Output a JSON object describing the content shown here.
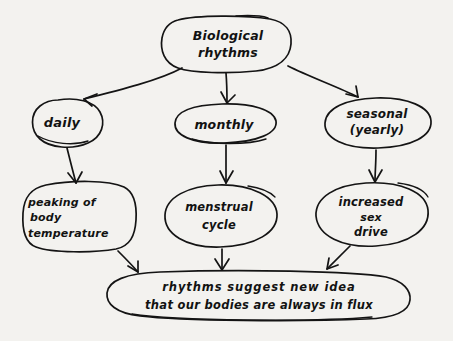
{
  "diagram": {
    "style": "hand-drawn-ink-on-paper",
    "ink_color": "#141414",
    "paper_color": "#f3f2ef",
    "nodes": [
      {
        "id": "root",
        "lines": [
          "Biological",
          "rhythms"
        ],
        "tier": 0
      },
      {
        "id": "daily",
        "lines": [
          "daily"
        ],
        "tier": 1
      },
      {
        "id": "monthly",
        "lines": [
          "monthly"
        ],
        "tier": 1
      },
      {
        "id": "seasonal",
        "lines": [
          "seasonal",
          "(yearly)"
        ],
        "tier": 1
      },
      {
        "id": "peaking",
        "lines": [
          "peaking of",
          "body",
          "temperature"
        ],
        "tier": 2
      },
      {
        "id": "menstrual",
        "lines": [
          "menstrual",
          "cycle"
        ],
        "tier": 2
      },
      {
        "id": "sexdrive",
        "lines": [
          "increased",
          "sex",
          "drive"
        ],
        "tier": 2
      },
      {
        "id": "conclusion",
        "lines": [
          "rhythms  suggest  new  idea",
          "that our bodies are always in flux"
        ],
        "tier": 3
      }
    ],
    "edges": [
      {
        "from": "root",
        "to": "daily"
      },
      {
        "from": "root",
        "to": "monthly"
      },
      {
        "from": "root",
        "to": "seasonal"
      },
      {
        "from": "daily",
        "to": "peaking"
      },
      {
        "from": "monthly",
        "to": "menstrual"
      },
      {
        "from": "seasonal",
        "to": "sexdrive"
      },
      {
        "from": "peaking",
        "to": "conclusion"
      },
      {
        "from": "menstrual",
        "to": "conclusion"
      },
      {
        "from": "sexdrive",
        "to": "conclusion"
      }
    ]
  }
}
